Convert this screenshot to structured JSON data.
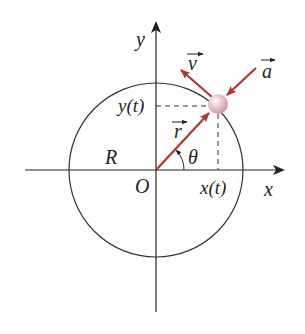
{
  "diagram": {
    "type": "circular-motion",
    "labels": {
      "y_axis": "y",
      "x_axis": "x",
      "origin": "O",
      "radius": "R",
      "angle": "θ",
      "x_of_t": "x(t)",
      "y_of_t": "y(t)",
      "position_vector": "r",
      "velocity_vector": "v",
      "acceleration_vector": "a"
    },
    "colors": {
      "axis": "#222222",
      "circle": "#333333",
      "vector": "#b0352f",
      "particle": "#e8b9c0",
      "dashed": "#333333"
    }
  }
}
